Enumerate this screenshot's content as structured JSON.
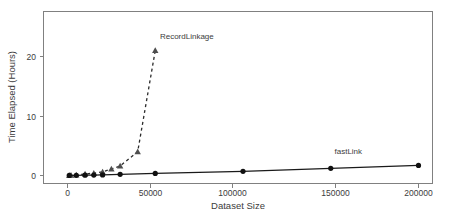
{
  "chart_data": {
    "type": "line",
    "title": "",
    "xlabel": "Dataset Size",
    "ylabel": "Time Elapsed (Hours)",
    "xlim": [
      0,
      212000
    ],
    "ylim": [
      0,
      27
    ],
    "grid": false,
    "legend_position": "inline-annotation",
    "xticks": [
      0,
      50000,
      100000,
      150000,
      200000
    ],
    "xtick_labels": [
      "0",
      "50000",
      "100000",
      "150000",
      "200000"
    ],
    "yticks": [
      0,
      10,
      20
    ],
    "ytick_labels": [
      "0",
      "10",
      "20"
    ],
    "series": [
      {
        "name": "RecordLinkage",
        "label": "RecordLinkage",
        "marker": "triangle",
        "linestyle": "dashed",
        "color": "#2b2b2b",
        "x": [
          1000,
          2000,
          5000,
          10000,
          15000,
          20000,
          25000,
          30000,
          40000,
          50000
        ],
        "y": [
          0.02,
          0.05,
          0.1,
          0.25,
          0.4,
          0.6,
          1.1,
          1.6,
          4.0,
          21.0
        ]
      },
      {
        "name": "fastLink",
        "label": "fastLink",
        "marker": "circle",
        "linestyle": "solid",
        "color": "#111111",
        "x": [
          1000,
          5000,
          10000,
          15000,
          20000,
          30000,
          50000,
          100000,
          150000,
          200000
        ],
        "y": [
          0.02,
          0.03,
          0.05,
          0.07,
          0.1,
          0.2,
          0.35,
          0.7,
          1.2,
          1.7
        ]
      }
    ],
    "annotations": [
      {
        "text": "RecordLinkage",
        "x": 68000,
        "y": 23.0
      },
      {
        "text": "fastLink",
        "x": 160000,
        "y": 3.6
      }
    ]
  }
}
